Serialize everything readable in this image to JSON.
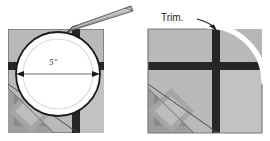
{
  "figure": {
    "panels": [
      {
        "id": "left",
        "name": "trace-circle-panel",
        "label": "5\"",
        "label_meaning": "circle diameter dimension",
        "annotations": [
          "dimension-arrow-line",
          "pencil"
        ],
        "block": {
          "fill": "#b9b9b9",
          "border_color": "#5a5a5a",
          "sashing_color": "#262626",
          "pinwheel_color": "#8e8e8e",
          "x": 8,
          "y": 29,
          "w": 96,
          "h": 104
        },
        "circle": {
          "fill": "#ffffff",
          "outline": "#1a1a1a",
          "inner_guide": "#d9d9d9",
          "cx": 58,
          "cy": 74,
          "r": 42
        }
      },
      {
        "id": "right",
        "name": "trim-corner-panel",
        "label": "Trim.",
        "label_meaning": "instruction to cut away corner along curve",
        "annotations": [
          "curved-trim-arrow",
          "arrowhead"
        ],
        "block": {
          "fill": "#b9b9b9",
          "border_color": "#5a5a5a",
          "sashing_color": "#262626",
          "pinwheel_color": "#8e8e8e",
          "x": 13,
          "y": 29,
          "w": 114,
          "h": 104
        },
        "trim_curve": {
          "stroke": "#ffffff",
          "radius": 52
        }
      }
    ],
    "colors": {
      "block_gray": "#b9b9b9",
      "dark_sashing": "#262626",
      "mid_gray": "#8e8e8e",
      "ink": "#1a1a1a",
      "white": "#ffffff",
      "pencil_body": "#a8a8a8",
      "pencil_edge": "#555555"
    }
  }
}
